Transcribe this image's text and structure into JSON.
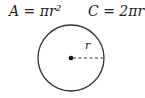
{
  "formulas": {
    "area": "A = πr²",
    "circumference": "C = 2πr"
  },
  "circle": {
    "radius_label": "r",
    "center": [
      71,
      58
    ],
    "radius_px": 33,
    "stroke": "#333333"
  }
}
